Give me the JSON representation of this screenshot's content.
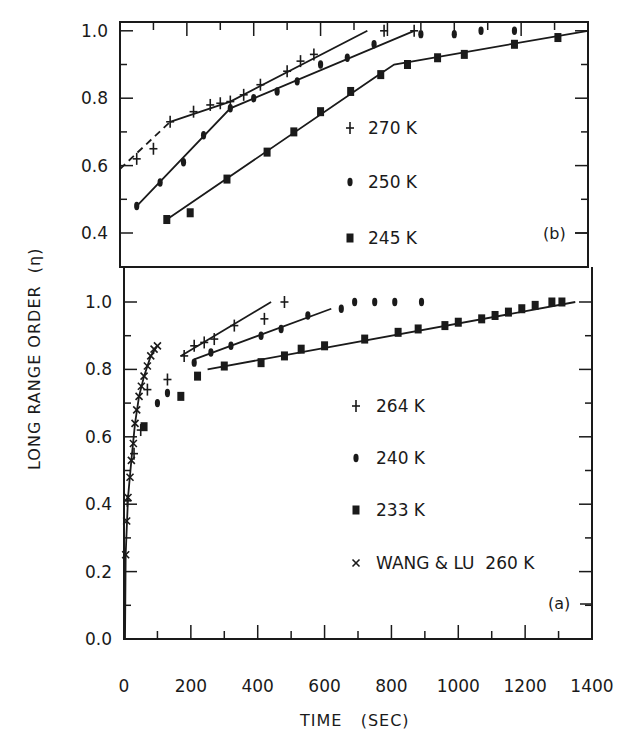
{
  "figure": {
    "ylabel": "LONG RANGE ORDER  (η)",
    "xlabel": "TIME   (SEC)",
    "x_ticks": [
      "0",
      "200",
      "400",
      "600",
      "800",
      "1000",
      "1200",
      "1400"
    ]
  },
  "chart_data": [
    {
      "panel": "(b)",
      "type": "scatter",
      "title": "",
      "xlabel": "TIME (SEC)",
      "ylabel": "LONG RANGE ORDER (η)",
      "xlim": [
        0,
        1400
      ],
      "ylim": [
        0.3,
        1.05
      ],
      "y_ticks": [
        1.0,
        0.8,
        0.6,
        0.4
      ],
      "y_tick_labels": [
        "1.0",
        "0.8",
        "0.6",
        "0.4"
      ],
      "grid": false,
      "legend_position": "center-right",
      "series": [
        {
          "name": "270 K",
          "marker": "plus",
          "points": [
            [
              50,
              0.62
            ],
            [
              100,
              0.65
            ],
            [
              150,
              0.73
            ],
            [
              220,
              0.76
            ],
            [
              270,
              0.78
            ],
            [
              300,
              0.785
            ],
            [
              330,
              0.79
            ],
            [
              370,
              0.81
            ],
            [
              420,
              0.84
            ],
            [
              500,
              0.88
            ],
            [
              540,
              0.91
            ],
            [
              580,
              0.93
            ],
            [
              790,
              1.0
            ],
            [
              880,
              1.0
            ]
          ],
          "fit_dashed": [
            [
              0,
              0.59
            ],
            [
              150,
              0.73
            ]
          ],
          "fit": [
            [
              150,
              0.73
            ],
            [
              330,
              0.79
            ],
            [
              740,
              1.0
            ]
          ]
        },
        {
          "name": "250 K",
          "marker": "diamond",
          "points": [
            [
              50,
              0.48
            ],
            [
              120,
              0.55
            ],
            [
              190,
              0.61
            ],
            [
              250,
              0.69
            ],
            [
              330,
              0.77
            ],
            [
              400,
              0.8
            ],
            [
              470,
              0.82
            ],
            [
              530,
              0.85
            ],
            [
              600,
              0.9
            ],
            [
              680,
              0.92
            ],
            [
              760,
              0.96
            ],
            [
              900,
              0.99
            ],
            [
              1000,
              0.99
            ],
            [
              1080,
              1.0
            ],
            [
              1180,
              1.0
            ]
          ],
          "fit": [
            [
              50,
              0.48
            ],
            [
              330,
              0.77
            ],
            [
              880,
              1.0
            ]
          ]
        },
        {
          "name": "245 K",
          "marker": "square",
          "points": [
            [
              140,
              0.44
            ],
            [
              210,
              0.46
            ],
            [
              320,
              0.56
            ],
            [
              440,
              0.64
            ],
            [
              520,
              0.7
            ],
            [
              600,
              0.76
            ],
            [
              690,
              0.82
            ],
            [
              780,
              0.87
            ],
            [
              860,
              0.9
            ],
            [
              950,
              0.92
            ],
            [
              1030,
              0.93
            ],
            [
              1180,
              0.96
            ],
            [
              1310,
              0.98
            ]
          ],
          "fit": [
            [
              140,
              0.44
            ],
            [
              760,
              0.86
            ],
            [
              820,
              0.9
            ],
            [
              1400,
              1.0
            ]
          ]
        }
      ]
    },
    {
      "panel": "(a)",
      "type": "scatter",
      "title": "",
      "xlabel": "TIME (SEC)",
      "ylabel": "LONG RANGE ORDER (η)",
      "xlim": [
        0,
        1400
      ],
      "ylim": [
        0.0,
        1.1
      ],
      "y_ticks": [
        1.0,
        0.8,
        0.6,
        0.4,
        0.2,
        0.0
      ],
      "y_tick_labels": [
        "1.0",
        "0.8",
        "0.6",
        "0.4",
        "0.2",
        "0.0"
      ],
      "grid": false,
      "legend_position": "center-right",
      "series": [
        {
          "name": "264 K",
          "marker": "plus",
          "points": [
            [
              10,
              0.41
            ],
            [
              30,
              0.55
            ],
            [
              50,
              0.62
            ],
            [
              70,
              0.74
            ],
            [
              130,
              0.77
            ],
            [
              180,
              0.84
            ],
            [
              210,
              0.87
            ],
            [
              240,
              0.88
            ],
            [
              270,
              0.89
            ],
            [
              330,
              0.93
            ],
            [
              420,
              0.95
            ],
            [
              480,
              1.0
            ]
          ],
          "fit": [
            [
              170,
              0.84
            ],
            [
              440,
              1.0
            ]
          ]
        },
        {
          "name": "240 K",
          "marker": "diamond",
          "points": [
            [
              100,
              0.7
            ],
            [
              130,
              0.73
            ],
            [
              210,
              0.82
            ],
            [
              260,
              0.85
            ],
            [
              320,
              0.87
            ],
            [
              410,
              0.9
            ],
            [
              470,
              0.92
            ],
            [
              550,
              0.96
            ],
            [
              650,
              0.98
            ],
            [
              690,
              1.0
            ],
            [
              750,
              1.0
            ],
            [
              810,
              1.0
            ],
            [
              890,
              1.0
            ]
          ],
          "fit": [
            [
              210,
              0.83
            ],
            [
              620,
              0.98
            ]
          ]
        },
        {
          "name": "233 K",
          "marker": "square",
          "points": [
            [
              60,
              0.63
            ],
            [
              170,
              0.72
            ],
            [
              220,
              0.78
            ],
            [
              300,
              0.81
            ],
            [
              410,
              0.82
            ],
            [
              480,
              0.84
            ],
            [
              530,
              0.86
            ],
            [
              600,
              0.87
            ],
            [
              720,
              0.89
            ],
            [
              820,
              0.91
            ],
            [
              880,
              0.92
            ],
            [
              960,
              0.93
            ],
            [
              1000,
              0.94
            ],
            [
              1070,
              0.95
            ],
            [
              1110,
              0.96
            ],
            [
              1150,
              0.97
            ],
            [
              1190,
              0.98
            ],
            [
              1230,
              0.99
            ],
            [
              1280,
              1.0
            ],
            [
              1310,
              1.0
            ]
          ],
          "fit": [
            [
              250,
              0.8
            ],
            [
              1350,
              1.0
            ]
          ]
        },
        {
          "name": "WANG & LU  260 K",
          "marker": "x",
          "points": [
            [
              5,
              0.25
            ],
            [
              8,
              0.35
            ],
            [
              12,
              0.42
            ],
            [
              18,
              0.48
            ],
            [
              22,
              0.53
            ],
            [
              28,
              0.58
            ],
            [
              33,
              0.64
            ],
            [
              38,
              0.68
            ],
            [
              45,
              0.72
            ],
            [
              52,
              0.75
            ],
            [
              60,
              0.78
            ],
            [
              70,
              0.81
            ],
            [
              80,
              0.84
            ],
            [
              90,
              0.86
            ],
            [
              100,
              0.87
            ]
          ],
          "fit": [
            [
              3,
              0.0
            ],
            [
              5,
              0.25
            ],
            [
              12,
              0.42
            ],
            [
              22,
              0.53
            ],
            [
              33,
              0.64
            ],
            [
              45,
              0.72
            ],
            [
              60,
              0.78
            ],
            [
              80,
              0.84
            ],
            [
              100,
              0.87
            ]
          ]
        }
      ]
    }
  ],
  "colors": {
    "ink": "#1a1a1a",
    "paper": "#ffffff"
  }
}
